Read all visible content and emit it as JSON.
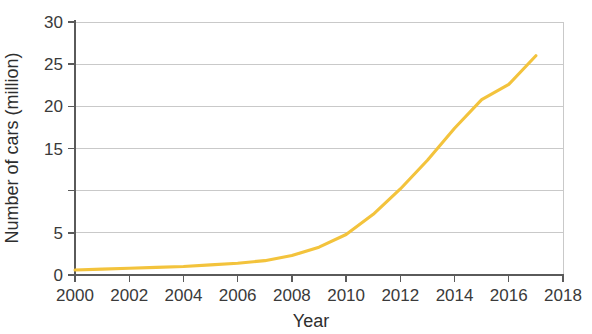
{
  "chart_data": {
    "type": "line",
    "title": "",
    "xlabel": "Year",
    "ylabel": "Number of cars (million)",
    "xlim": [
      2000,
      2018
    ],
    "ylim": [
      0,
      30
    ],
    "grid": true,
    "legend": false,
    "legend_position": "none",
    "line_color": "#F3C33C",
    "axis_color": "#5a5a5a",
    "grid_color": "#c9c9c9",
    "x_ticks": [
      "2000",
      "2002",
      "2004",
      "2006",
      "2008",
      "2010",
      "2012",
      "2014",
      "2016",
      "2018"
    ],
    "x_tick_values": [
      2000,
      2002,
      2004,
      2006,
      2008,
      2010,
      2012,
      2014,
      2016,
      2018
    ],
    "y_ticks": [
      "30",
      "25",
      "20",
      "15",
      "",
      "5",
      "0"
    ],
    "y_tick_values": [
      30,
      25,
      20,
      15,
      10,
      5,
      0
    ],
    "series": [
      {
        "name": "Number of cars",
        "x": [
          2000,
          2001,
          2002,
          2003,
          2004,
          2005,
          2006,
          2007,
          2008,
          2009,
          2010,
          2011,
          2012,
          2013,
          2014,
          2015,
          2016,
          2017
        ],
        "values": [
          0.6,
          0.7,
          0.8,
          0.9,
          1.0,
          1.2,
          1.4,
          1.7,
          2.3,
          3.3,
          4.8,
          7.2,
          10.2,
          13.6,
          17.4,
          20.8,
          22.6,
          26.0
        ]
      }
    ]
  }
}
